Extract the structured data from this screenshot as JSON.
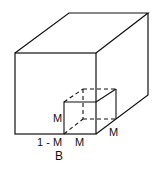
{
  "diagram": {
    "type": "isometric-cube-with-subcube",
    "colors": {
      "stroke": "#111111",
      "background": "#ffffff"
    },
    "labels": {
      "subcube_height": "M",
      "bottom_left_segment": "1 - M",
      "bottom_subcube_width": "M",
      "depth": "M",
      "caption": "B"
    }
  }
}
